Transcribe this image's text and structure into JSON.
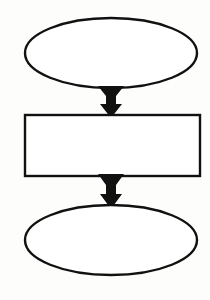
{
  "diagram": {
    "type": "flowchart",
    "orientation": "vertical",
    "background_color": "#fdfdfc",
    "stroke_color": "#111111",
    "fill_color": "#ffffff",
    "arrow_color": "#111111",
    "nodes": [
      {
        "id": "start",
        "shape": "ellipse",
        "label": "",
        "cx": 111,
        "cy": 53,
        "rx": 86,
        "ry": 35,
        "stroke_width": 2.4
      },
      {
        "id": "process",
        "shape": "rectangle",
        "label": "",
        "x": 25,
        "y": 115,
        "width": 175,
        "height": 61,
        "stroke_width": 2.4
      },
      {
        "id": "end",
        "shape": "ellipse",
        "label": "",
        "cx": 111,
        "cy": 240,
        "rx": 86,
        "ry": 35,
        "stroke_width": 2.4
      }
    ],
    "connectors": [
      {
        "id": "start-to-process",
        "from": "start",
        "to": "process",
        "style": "tapered-solid-arrow",
        "direction": "down",
        "label": "",
        "x_center": 111,
        "y_top": 86,
        "y_bottom": 117,
        "top_half_width": 13,
        "shaft_half_width": 5,
        "head_half_width": 11
      },
      {
        "id": "process-to-end",
        "from": "process",
        "to": "end",
        "style": "tapered-solid-arrow",
        "direction": "down",
        "label": "",
        "x_center": 111,
        "y_top": 174,
        "y_bottom": 208,
        "top_half_width": 13,
        "shaft_half_width": 5,
        "head_half_width": 11
      }
    ]
  }
}
